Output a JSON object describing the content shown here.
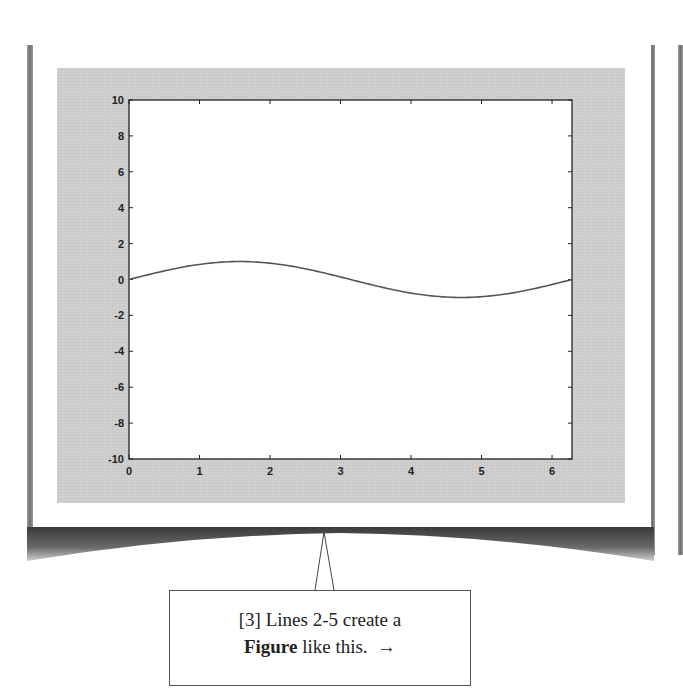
{
  "chart_data": {
    "type": "line",
    "title": "",
    "xlabel": "",
    "ylabel": "",
    "xlim": [
      0,
      6.283
    ],
    "ylim": [
      -10,
      10
    ],
    "grid": false,
    "x_ticks": [
      "0",
      "1",
      "2",
      "3",
      "4",
      "5",
      "6"
    ],
    "y_ticks": [
      "10",
      "8",
      "6",
      "4",
      "2",
      "0",
      "-2",
      "-4",
      "-6",
      "-8",
      "-10"
    ],
    "series": [
      {
        "name": "sin(x)",
        "function": "y = sin(x)",
        "x": [
          0,
          0.5,
          1.0,
          1.5708,
          2.0,
          2.5,
          3.1416,
          3.5,
          4.0,
          4.7124,
          5.0,
          5.5,
          6.2832
        ],
        "y": [
          0,
          0.479,
          0.841,
          1.0,
          0.909,
          0.598,
          0,
          -0.351,
          -0.757,
          -1.0,
          -0.959,
          -0.706,
          0
        ]
      }
    ]
  },
  "callout": {
    "prefix": "[3] Lines 2-5 create a",
    "bold_word": "Figure",
    "suffix": " like this.",
    "arrow": "→"
  }
}
